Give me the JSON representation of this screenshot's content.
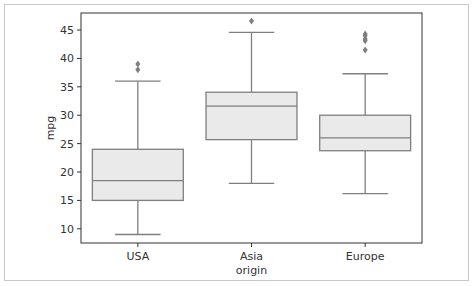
{
  "chart_data": {
    "type": "box",
    "title": "",
    "xlabel": "origin",
    "ylabel": "mpg",
    "ylim": [
      7.5,
      48.0
    ],
    "yticks": [
      10,
      15,
      20,
      25,
      30,
      35,
      40,
      45
    ],
    "categories": [
      "USA",
      "Asia",
      "Europe"
    ],
    "boxes": [
      {
        "name": "USA",
        "whisker_low": 9.0,
        "q1": 15.0,
        "median": 18.5,
        "q3": 24.0,
        "whisker_high": 36.0,
        "outliers": [
          38.0,
          39.0
        ]
      },
      {
        "name": "Asia",
        "whisker_low": 18.0,
        "q1": 25.7,
        "median": 31.6,
        "q3": 34.05,
        "whisker_high": 44.6,
        "outliers": [
          46.6
        ]
      },
      {
        "name": "Europe",
        "whisker_low": 16.2,
        "q1": 23.75,
        "median": 26.0,
        "q3": 30.0,
        "whisker_high": 37.3,
        "outliers": [
          41.5,
          43.1,
          43.4,
          44.0,
          44.3
        ]
      }
    ],
    "grid": false,
    "legend": "none",
    "colors": {
      "box_fill": "#eaeaea",
      "line": "#7f7f7f",
      "outlier": "#7f7f7f",
      "axis": "#333333"
    }
  }
}
